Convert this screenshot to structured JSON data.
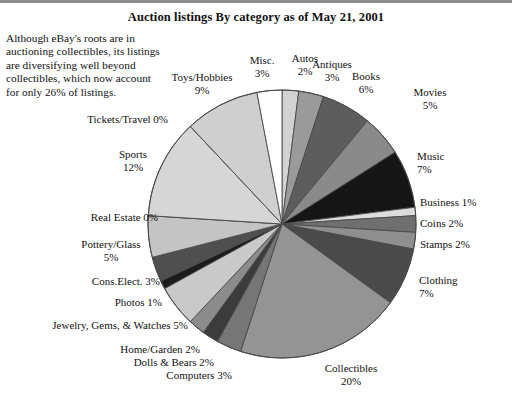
{
  "title": "Auction listings By category as of May 21, 2001",
  "caption": "Although eBay's roots are in auctioning collectibles, its listings are diversifying well beyond collectibles, which now account for only 26% of listings.",
  "labels": {
    "misc": "Misc.\n3%",
    "autos": "Autos\n2%",
    "antiques": "Antiques\n3%",
    "books": "Books\n6%",
    "movies": "Movies\n5%",
    "music": "Music\n7%",
    "business": "Business 1%",
    "coins": "Coins 2%",
    "stamps": "Stamps 2%",
    "clothing": "Clothing\n7%",
    "collectibles": "Collectibles\n20%",
    "computers": "Computers 3%",
    "dolls": "Dolls & Bears 2%",
    "homegarden": "Home/Garden 2%",
    "jewelry": "Jewelry, Gems, & Watches 5%",
    "photos": "Photos 1%",
    "conselect": "Cons.Elect. 3%",
    "pottery": "Pottery/Glass\n5%",
    "realestate": "Real Estate 0%",
    "sports": "Sports\n12%",
    "tickets": "Tickets/Travel 0%",
    "toys": "Toys/Hobbies\n9%"
  },
  "chart_data": {
    "type": "pie",
    "title": "Auction listings By category as of May 21, 2001",
    "start_angle_deg": 0,
    "direction": "clockwise",
    "legend": "none",
    "units": "percent",
    "categories": [
      "Autos",
      "Antiques",
      "Books",
      "Movies",
      "Music",
      "Business",
      "Coins",
      "Stamps",
      "Clothing",
      "Collectibles",
      "Computers",
      "Dolls & Bears",
      "Home/Garden",
      "Jewelry, Gems, & Watches",
      "Photos",
      "Cons.Elect.",
      "Pottery/Glass",
      "Real Estate",
      "Sports",
      "Tickets/Travel",
      "Toys/Hobbies",
      "Misc."
    ],
    "values": [
      2,
      3,
      6,
      5,
      7,
      1,
      2,
      2,
      7,
      20,
      3,
      2,
      2,
      5,
      1,
      3,
      5,
      0,
      12,
      0,
      9,
      3
    ],
    "colors": [
      "#d2d2d2",
      "#9a9a9a",
      "#5d5d5d",
      "#8a8a8a",
      "#161616",
      "#dcdcdc",
      "#6f6f6f",
      "#8f8f8f",
      "#4a4a4a",
      "#949494",
      "#767676",
      "#3c3c3c",
      "#8c8c8c",
      "#c9c9c9",
      "#1c1c1c",
      "#4f4f4f",
      "#c4c4c4",
      "#b8b8b8",
      "#d6d6d6",
      "#bdbdbd",
      "#cfcfcf",
      "#ffffff"
    ],
    "slice_stroke": "#4a4a4a"
  }
}
